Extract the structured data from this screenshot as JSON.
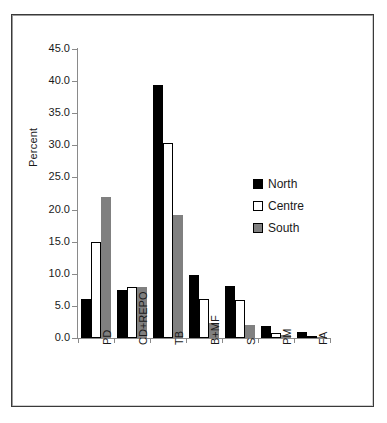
{
  "chart_data": {
    "type": "bar",
    "title": "",
    "xlabel": "",
    "ylabel": "Percent",
    "ylim": [
      0.0,
      45.0
    ],
    "ytick_step": 5.0,
    "ytick_labels": [
      "0.0",
      "5.0",
      "10.0",
      "15.0",
      "20.0",
      "25.0",
      "30.0",
      "35.0",
      "40.0",
      "45.0"
    ],
    "ytick_values": [
      0.0,
      5.0,
      10.0,
      15.0,
      20.0,
      25.0,
      30.0,
      35.0,
      40.0,
      45.0
    ],
    "grid": false,
    "legend_position": "right-middle",
    "categories": [
      "PD",
      "CD+REPO",
      "TB",
      "B+MF",
      "S",
      "PM",
      "FA"
    ],
    "series": [
      {
        "name": "North",
        "color": "#000000",
        "values": [
          6.0,
          7.5,
          39.4,
          9.8,
          8.1,
          1.9,
          0.9
        ]
      },
      {
        "name": "Centre",
        "color": "#ffffff",
        "values": [
          15.0,
          7.9,
          30.4,
          6.1,
          5.9,
          0.8,
          0.1
        ]
      },
      {
        "name": "South",
        "color": "#808080",
        "values": [
          22.0,
          7.9,
          19.2,
          2.3,
          2.0,
          0.4,
          0.05
        ]
      }
    ]
  },
  "axis": {
    "y_title": "Percent"
  },
  "legend": {
    "items": [
      {
        "label": "North"
      },
      {
        "label": "Centre"
      },
      {
        "label": "South"
      }
    ]
  },
  "colors": {
    "north": "#000000",
    "centre": "#ffffff",
    "south": "#808080",
    "axis": "#8a8a8a",
    "frame": "#3a3a3a",
    "text": "#1a1a1a",
    "background": "#ffffff"
  }
}
